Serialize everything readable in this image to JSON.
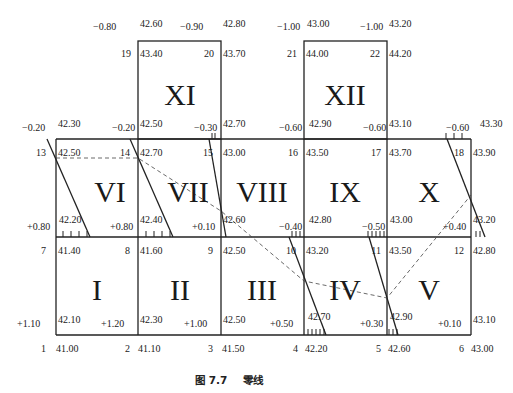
{
  "caption": {
    "figure_no": "图 7.7",
    "title": "零线"
  },
  "grid": {
    "x": [
      56,
      138,
      221,
      304,
      387,
      471
    ],
    "y_top_row": 41,
    "y": [
      139,
      237,
      335
    ]
  },
  "squares": [
    {
      "id": "I",
      "cx": 97,
      "cy": 300
    },
    {
      "id": "II",
      "cx": 180,
      "cy": 300
    },
    {
      "id": "III",
      "cx": 262,
      "cy": 300
    },
    {
      "id": "IV",
      "cx": 345,
      "cy": 300
    },
    {
      "id": "V",
      "cx": 429,
      "cy": 300
    },
    {
      "id": "VI",
      "cx": 110,
      "cy": 202
    },
    {
      "id": "VII",
      "cx": 188,
      "cy": 202
    },
    {
      "id": "VIII",
      "cx": 262,
      "cy": 202
    },
    {
      "id": "IX",
      "cx": 345,
      "cy": 202
    },
    {
      "id": "X",
      "cx": 429,
      "cy": 202
    },
    {
      "id": "XI",
      "cx": 180,
      "cy": 105
    },
    {
      "id": "XII",
      "cx": 345,
      "cy": 105
    }
  ],
  "points": [
    {
      "no": "1",
      "ground": "41.00",
      "design": "42.10",
      "cut_fill": "+1.10"
    },
    {
      "no": "2",
      "ground": "41.10",
      "design": "42.30",
      "cut_fill": "+1.20"
    },
    {
      "no": "3",
      "ground": "41.50",
      "design": "42.50",
      "cut_fill": "+1.00"
    },
    {
      "no": "4",
      "ground": "42.20",
      "design": "42.70",
      "cut_fill": "+0.50"
    },
    {
      "no": "5",
      "ground": "42.60",
      "design": "42.90",
      "cut_fill": "+0.30"
    },
    {
      "no": "6",
      "ground": "43.00",
      "design": "43.10",
      "cut_fill": "+0.10"
    },
    {
      "no": "7",
      "ground": "41.40",
      "design": "42.20",
      "cut_fill": "+0.80"
    },
    {
      "no": "8",
      "ground": "41.60",
      "design": "42.40",
      "cut_fill": "+0.80"
    },
    {
      "no": "9",
      "ground": "42.50",
      "design": "42.60",
      "cut_fill": "+0.10"
    },
    {
      "no": "10",
      "ground": "43.20",
      "design": "42.80",
      "cut_fill": "-0.40"
    },
    {
      "no": "11",
      "ground": "43.50",
      "design": "43.00",
      "cut_fill": "-0.50"
    },
    {
      "no": "12",
      "ground": "42.80",
      "design": "43.20",
      "cut_fill": "+0.40"
    },
    {
      "no": "13",
      "ground": "42.50",
      "design": "42.30",
      "cut_fill": "-0.20"
    },
    {
      "no": "14",
      "ground": "42.70",
      "design": "42.50",
      "cut_fill": "-0.20"
    },
    {
      "no": "15",
      "ground": "43.00",
      "design": "42.70",
      "cut_fill": "-0.30"
    },
    {
      "no": "16",
      "ground": "43.50",
      "design": "42.90",
      "cut_fill": "-0.60"
    },
    {
      "no": "17",
      "ground": "43.70",
      "design": "43.10",
      "cut_fill": "-0.60"
    },
    {
      "no": "18",
      "ground": "43.90",
      "design": "43.30",
      "cut_fill": "-0.60"
    },
    {
      "no": "19",
      "ground": "43.40",
      "design": "42.60",
      "cut_fill": "-0.80"
    },
    {
      "no": "20",
      "ground": "43.70",
      "design": "42.80",
      "cut_fill": "-0.90"
    },
    {
      "no": "21",
      "ground": "44.00",
      "design": "43.00",
      "cut_fill": "-1.00"
    },
    {
      "no": "22",
      "ground": "44.20",
      "design": "43.20",
      "cut_fill": "-1.00"
    }
  ],
  "labels": [
    {
      "t": "-0.80",
      "x": 93,
      "y": 30,
      "a": "start"
    },
    {
      "t": "42.60",
      "x": 140,
      "y": 27,
      "a": "start"
    },
    {
      "t": "-0.90",
      "x": 180,
      "y": 30,
      "a": "start"
    },
    {
      "t": "42.80",
      "x": 223,
      "y": 27,
      "a": "start"
    },
    {
      "t": "-1.00",
      "x": 277,
      "y": 30,
      "a": "start"
    },
    {
      "t": "43.00",
      "x": 307,
      "y": 27,
      "a": "start"
    },
    {
      "t": "-1.00",
      "x": 360,
      "y": 30,
      "a": "start"
    },
    {
      "t": "43.20",
      "x": 389,
      "y": 27,
      "a": "start"
    },
    {
      "t": "19",
      "x": 131,
      "y": 57,
      "a": "end"
    },
    {
      "t": "43.40",
      "x": 140,
      "y": 57,
      "a": "start"
    },
    {
      "t": "20",
      "x": 214,
      "y": 57,
      "a": "end"
    },
    {
      "t": "43.70",
      "x": 223,
      "y": 57,
      "a": "start"
    },
    {
      "t": "21",
      "x": 297,
      "y": 57,
      "a": "end"
    },
    {
      "t": "44.00",
      "x": 306,
      "y": 57,
      "a": "start"
    },
    {
      "t": "22",
      "x": 380,
      "y": 57,
      "a": "end"
    },
    {
      "t": "44.20",
      "x": 389,
      "y": 57,
      "a": "start"
    },
    {
      "t": "-0.20",
      "x": 22,
      "y": 131,
      "a": "start"
    },
    {
      "t": "42.30",
      "x": 58,
      "y": 127,
      "a": "start"
    },
    {
      "t": "-0.20",
      "x": 112,
      "y": 131,
      "a": "start"
    },
    {
      "t": "42.50",
      "x": 140,
      "y": 127,
      "a": "start"
    },
    {
      "t": "-0.30",
      "x": 194,
      "y": 131,
      "a": "start"
    },
    {
      "t": "42.70",
      "x": 223,
      "y": 127,
      "a": "start"
    },
    {
      "t": "-0.60",
      "x": 279,
      "y": 131,
      "a": "start"
    },
    {
      "t": "42.90",
      "x": 309,
      "y": 127,
      "a": "start"
    },
    {
      "t": "-0.60",
      "x": 363,
      "y": 131,
      "a": "start"
    },
    {
      "t": "43.10",
      "x": 389,
      "y": 127,
      "a": "start"
    },
    {
      "t": "-0.60",
      "x": 446,
      "y": 131,
      "a": "start"
    },
    {
      "t": "43.30",
      "x": 480,
      "y": 127,
      "a": "start"
    },
    {
      "t": "13",
      "x": 46,
      "y": 156,
      "a": "end"
    },
    {
      "t": "42.50",
      "x": 58,
      "y": 156,
      "a": "start"
    },
    {
      "t": "14",
      "x": 130,
      "y": 156,
      "a": "end"
    },
    {
      "t": "42.70",
      "x": 140,
      "y": 156,
      "a": "start"
    },
    {
      "t": "15",
      "x": 213,
      "y": 156,
      "a": "end"
    },
    {
      "t": "43.00",
      "x": 223,
      "y": 156,
      "a": "start"
    },
    {
      "t": "16",
      "x": 298,
      "y": 156,
      "a": "end"
    },
    {
      "t": "43.50",
      "x": 306,
      "y": 156,
      "a": "start"
    },
    {
      "t": "17",
      "x": 381,
      "y": 156,
      "a": "end"
    },
    {
      "t": "43.70",
      "x": 389,
      "y": 156,
      "a": "start"
    },
    {
      "t": "18",
      "x": 464,
      "y": 156,
      "a": "end"
    },
    {
      "t": "43.90",
      "x": 473,
      "y": 156,
      "a": "start"
    },
    {
      "t": "+0.80",
      "x": 27,
      "y": 230,
      "a": "start"
    },
    {
      "t": "42.20",
      "x": 59,
      "y": 223,
      "a": "start"
    },
    {
      "t": "+0.80",
      "x": 110,
      "y": 230,
      "a": "start"
    },
    {
      "t": "42.40",
      "x": 140,
      "y": 223,
      "a": "start"
    },
    {
      "t": "+0.10",
      "x": 192,
      "y": 230,
      "a": "start"
    },
    {
      "t": "42.60",
      "x": 223,
      "y": 223,
      "a": "start"
    },
    {
      "t": "-0.40",
      "x": 279,
      "y": 230,
      "a": "start"
    },
    {
      "t": "42.80",
      "x": 309,
      "y": 223,
      "a": "start"
    },
    {
      "t": "-0.50",
      "x": 362,
      "y": 230,
      "a": "start"
    },
    {
      "t": "43.00",
      "x": 390,
      "y": 223,
      "a": "start"
    },
    {
      "t": "+0.40",
      "x": 443,
      "y": 230,
      "a": "start"
    },
    {
      "t": "43.20",
      "x": 473,
      "y": 223,
      "a": "start"
    },
    {
      "t": "7",
      "x": 46,
      "y": 254,
      "a": "end"
    },
    {
      "t": "41.40",
      "x": 58,
      "y": 254,
      "a": "start"
    },
    {
      "t": "8",
      "x": 130,
      "y": 254,
      "a": "end"
    },
    {
      "t": "41.60",
      "x": 140,
      "y": 254,
      "a": "start"
    },
    {
      "t": "9",
      "x": 213,
      "y": 254,
      "a": "end"
    },
    {
      "t": "42.50",
      "x": 223,
      "y": 254,
      "a": "start"
    },
    {
      "t": "10",
      "x": 296,
      "y": 254,
      "a": "end"
    },
    {
      "t": "43.20",
      "x": 306,
      "y": 254,
      "a": "start"
    },
    {
      "t": "11",
      "x": 381,
      "y": 254,
      "a": "end"
    },
    {
      "t": "43.50",
      "x": 389,
      "y": 254,
      "a": "start"
    },
    {
      "t": "12",
      "x": 464,
      "y": 254,
      "a": "end"
    },
    {
      "t": "42.80",
      "x": 473,
      "y": 254,
      "a": "start"
    },
    {
      "t": "+1.10",
      "x": 17,
      "y": 327,
      "a": "start"
    },
    {
      "t": "42.10",
      "x": 58,
      "y": 323,
      "a": "start"
    },
    {
      "t": "+1.20",
      "x": 101,
      "y": 327,
      "a": "start"
    },
    {
      "t": "42.30",
      "x": 140,
      "y": 323,
      "a": "start"
    },
    {
      "t": "+1.00",
      "x": 184,
      "y": 327,
      "a": "start"
    },
    {
      "t": "42.50",
      "x": 223,
      "y": 323,
      "a": "start"
    },
    {
      "t": "+0.50",
      "x": 270,
      "y": 327,
      "a": "start"
    },
    {
      "t": "42.70",
      "x": 308,
      "y": 320,
      "a": "start"
    },
    {
      "t": "+0.30",
      "x": 360,
      "y": 327,
      "a": "start"
    },
    {
      "t": "42.90",
      "x": 390,
      "y": 320,
      "a": "start"
    },
    {
      "t": "+0.10",
      "x": 438,
      "y": 327,
      "a": "start"
    },
    {
      "t": "43.10",
      "x": 473,
      "y": 323,
      "a": "start"
    },
    {
      "t": "1",
      "x": 46,
      "y": 352,
      "a": "end"
    },
    {
      "t": "41.00",
      "x": 56,
      "y": 352,
      "a": "start"
    },
    {
      "t": "2",
      "x": 130,
      "y": 352,
      "a": "end"
    },
    {
      "t": "41.10",
      "x": 138,
      "y": 352,
      "a": "start"
    },
    {
      "t": "3",
      "x": 213,
      "y": 352,
      "a": "end"
    },
    {
      "t": "41.50",
      "x": 222,
      "y": 352,
      "a": "start"
    },
    {
      "t": "4",
      "x": 298,
      "y": 352,
      "a": "end"
    },
    {
      "t": "42.20",
      "x": 305,
      "y": 352,
      "a": "start"
    },
    {
      "t": "5",
      "x": 381,
      "y": 352,
      "a": "end"
    },
    {
      "t": "42.60",
      "x": 388,
      "y": 352,
      "a": "start"
    },
    {
      "t": "6",
      "x": 464,
      "y": 352,
      "a": "end"
    },
    {
      "t": "43.00",
      "x": 471,
      "y": 352,
      "a": "start"
    }
  ],
  "zero_lines": [
    {
      "d": "M47,139 L90,237",
      "ticks_x": [
        63,
        71,
        79,
        87
      ],
      "ticks_y": 237
    },
    {
      "d": "M130,139 L173,237",
      "ticks_x": [
        146,
        154,
        162,
        170
      ],
      "ticks_y": 237
    },
    {
      "d": "M209,139 L226,237",
      "ticks_x": [
        212,
        215
      ],
      "ticks_y": 139,
      "ticks_up": true
    },
    {
      "d": "M289,237 L326,335",
      "ticks_x": [
        292,
        296,
        300
      ],
      "ticks_y": 237,
      "ticks_up": true
    },
    {
      "d": "M369,237 L398,335",
      "ticks_x": [
        368,
        372,
        376,
        380,
        384
      ],
      "ticks_y": 237,
      "ticks_up": true
    },
    {
      "d": "M447,139 L485,237",
      "ticks_x": [
        446,
        454,
        462
      ],
      "ticks_y": 139,
      "ticks_up": true
    }
  ],
  "zero_lines_bottom_ticks": [
    {
      "x": [
        308,
        312,
        316,
        320,
        324
      ],
      "y": 335
    },
    {
      "x": [
        389,
        393,
        397
      ],
      "y": 335
    },
    {
      "x": [
        476,
        480
      ],
      "y": 237
    }
  ],
  "dashed_path": "M56,158 L138,158 L221,211 L304,281 L387,298 L471,195"
}
